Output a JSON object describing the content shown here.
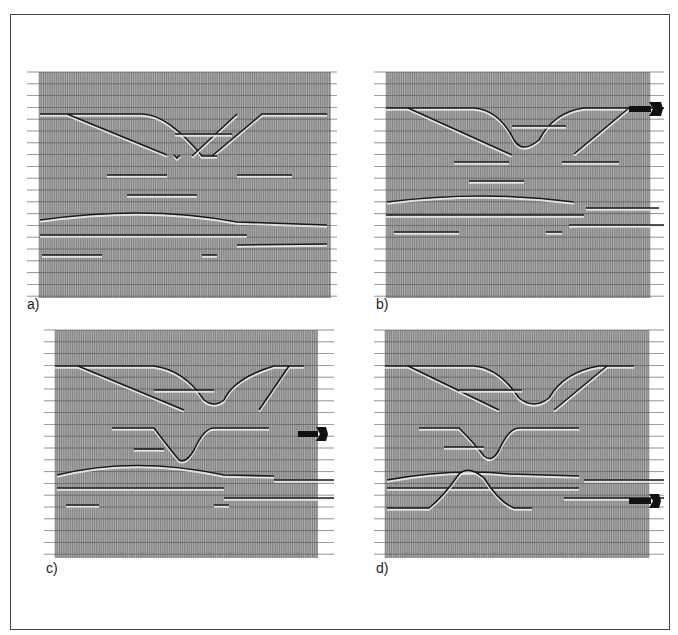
{
  "figure": {
    "panels": [
      {
        "id": "a",
        "label": "a)",
        "arrow": null
      },
      {
        "id": "b",
        "label": "b)",
        "arrow": "reflector-marker"
      },
      {
        "id": "c",
        "label": "c)",
        "arrow": "reflector-marker"
      },
      {
        "id": "d",
        "label": "d)",
        "arrow": "reflector-marker"
      }
    ]
  },
  "style": {
    "background": "#a9a9a9",
    "trace_color": "#2e2e2e",
    "reflector_color": "#1a1a1a",
    "highlight_color": "#f0f0f0"
  }
}
